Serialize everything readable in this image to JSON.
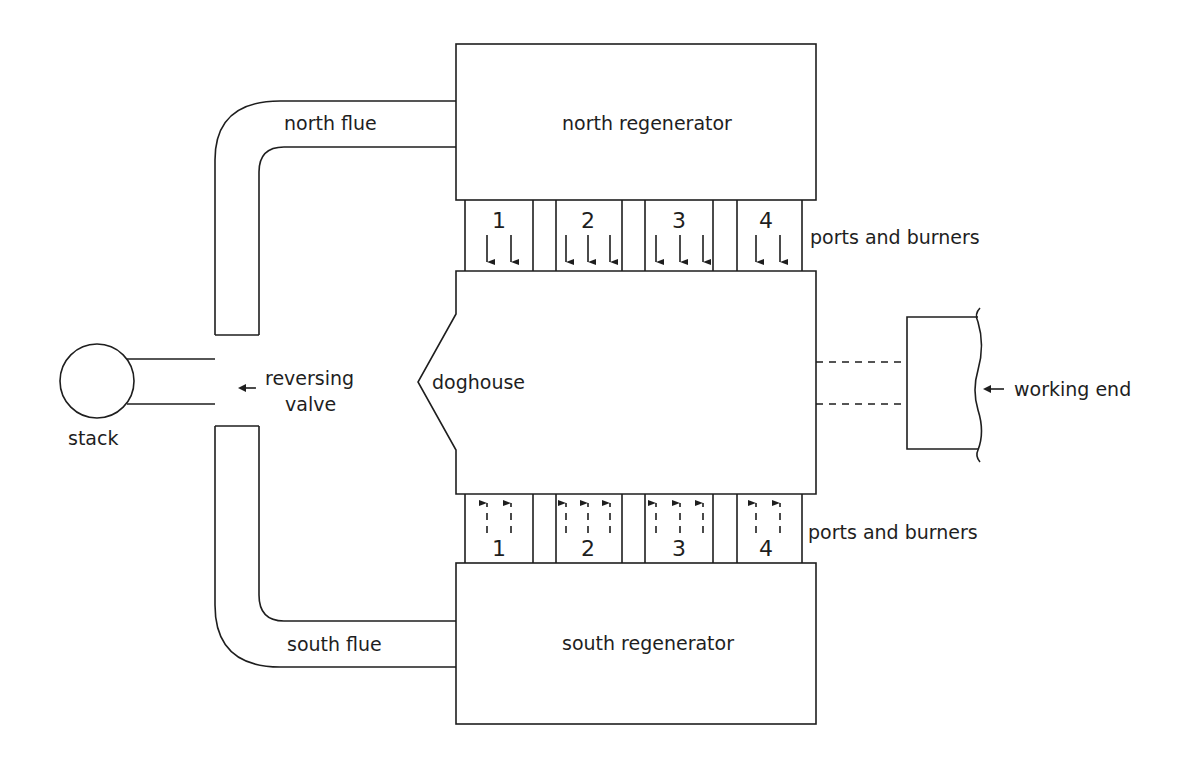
{
  "diagram": {
    "type": "regenerative furnace schematic",
    "labels": {
      "north_flue": "north flue",
      "south_flue": "south flue",
      "north_regenerator": "north regenerator",
      "south_regenerator": "south regenerator",
      "ports_top": "ports and burners",
      "ports_bottom": "ports and burners",
      "stack": "stack",
      "reversing_valve_line1": "reversing",
      "reversing_valve_line2": "valve",
      "doghouse": "doghouse",
      "working_end": "working end"
    },
    "north_ports": [
      {
        "number": "1",
        "arrows": 2,
        "direction": "down"
      },
      {
        "number": "2",
        "arrows": 3,
        "direction": "down"
      },
      {
        "number": "3",
        "arrows": 3,
        "direction": "down"
      },
      {
        "number": "4",
        "arrows": 2,
        "direction": "down"
      }
    ],
    "south_ports": [
      {
        "number": "1",
        "arrows": 2,
        "direction": "up",
        "style": "dashed"
      },
      {
        "number": "2",
        "arrows": 3,
        "direction": "up",
        "style": "dashed"
      },
      {
        "number": "3",
        "arrows": 3,
        "direction": "up",
        "style": "dashed"
      },
      {
        "number": "4",
        "arrows": 2,
        "direction": "up",
        "style": "dashed"
      }
    ],
    "colors": {
      "line": "#1e1e1e",
      "background": "#ffffff"
    }
  }
}
